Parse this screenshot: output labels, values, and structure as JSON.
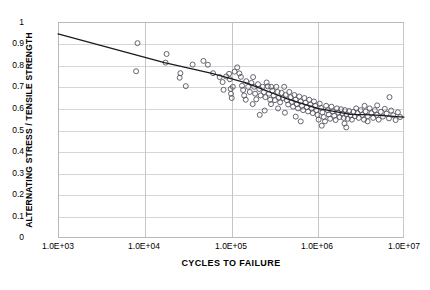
{
  "chart_data": {
    "type": "scatter",
    "title": "",
    "xlabel": "CYCLES TO FAILURE",
    "ylabel": "ALTERNATING STRESS / TENSILE STRENGTH",
    "xscale": "log",
    "yscale": "linear",
    "xlim": [
      1000,
      10000000
    ],
    "ylim": [
      0,
      1
    ],
    "grid": true,
    "legend": null,
    "xticks": [
      "1.0E+03",
      "1.0E+04",
      "1.0E+05",
      "1.0E+06",
      "1.0E+07"
    ],
    "xtick_values": [
      1000,
      10000,
      100000,
      1000000,
      10000000
    ],
    "yticks": [
      "0",
      "0.1",
      "0.2",
      "0.3",
      "0.4",
      "0.5",
      "0.6",
      "0.7",
      "0.8",
      "0.9",
      "1"
    ],
    "ytick_values": [
      0,
      0.1,
      0.2,
      0.3,
      0.4,
      0.5,
      0.6,
      0.7,
      0.8,
      0.9,
      1
    ],
    "marker": "open-circle",
    "marker_color": "#55555f",
    "series": [
      {
        "name": "fatigue data",
        "points": [
          [
            8300,
            0.902
          ],
          [
            8000,
            0.772
          ],
          [
            18000,
            0.852
          ],
          [
            17500,
            0.812
          ],
          [
            26000,
            0.763
          ],
          [
            25500,
            0.742
          ],
          [
            30000,
            0.703
          ],
          [
            36000,
            0.803
          ],
          [
            48000,
            0.82
          ],
          [
            54000,
            0.802
          ],
          [
            62000,
            0.763
          ],
          [
            74000,
            0.745
          ],
          [
            80000,
            0.722
          ],
          [
            82000,
            0.686
          ],
          [
            88000,
            0.748
          ],
          [
            95000,
            0.76
          ],
          [
            97000,
            0.735
          ],
          [
            99000,
            0.69
          ],
          [
            100000,
            0.668
          ],
          [
            102000,
            0.648
          ],
          [
            105000,
            0.7
          ],
          [
            110000,
            0.77
          ],
          [
            118000,
            0.79
          ],
          [
            125000,
            0.762
          ],
          [
            130000,
            0.746
          ],
          [
            134000,
            0.705
          ],
          [
            138000,
            0.685
          ],
          [
            142000,
            0.66
          ],
          [
            150000,
            0.726
          ],
          [
            158000,
            0.7
          ],
          [
            165000,
            0.676
          ],
          [
            172000,
            0.718
          ],
          [
            180000,
            0.745
          ],
          [
            185000,
            0.7
          ],
          [
            190000,
            0.668
          ],
          [
            196000,
            0.642
          ],
          [
            205000,
            0.712
          ],
          [
            212000,
            0.69
          ],
          [
            220000,
            0.66
          ],
          [
            232000,
            0.7
          ],
          [
            240000,
            0.675
          ],
          [
            250000,
            0.652
          ],
          [
            258000,
            0.72
          ],
          [
            266000,
            0.702
          ],
          [
            275000,
            0.668
          ],
          [
            284000,
            0.64
          ],
          [
            292000,
            0.7
          ],
          [
            300000,
            0.682
          ],
          [
            312000,
            0.66
          ],
          [
            322000,
            0.638
          ],
          [
            334000,
            0.7
          ],
          [
            345000,
            0.676
          ],
          [
            358000,
            0.65
          ],
          [
            370000,
            0.628
          ],
          [
            385000,
            0.672
          ],
          [
            398000,
            0.648
          ],
          [
            412000,
            0.7
          ],
          [
            428000,
            0.662
          ],
          [
            442000,
            0.638
          ],
          [
            458000,
            0.618
          ],
          [
            472000,
            0.676
          ],
          [
            490000,
            0.652
          ],
          [
            505000,
            0.63
          ],
          [
            522000,
            0.608
          ],
          [
            540000,
            0.662
          ],
          [
            558000,
            0.64
          ],
          [
            576000,
            0.62
          ],
          [
            595000,
            0.6
          ],
          [
            615000,
            0.655
          ],
          [
            638000,
            0.632
          ],
          [
            660000,
            0.612
          ],
          [
            682000,
            0.592
          ],
          [
            705000,
            0.648
          ],
          [
            728000,
            0.626
          ],
          [
            752000,
            0.606
          ],
          [
            778000,
            0.586
          ],
          [
            802000,
            0.64
          ],
          [
            828000,
            0.618
          ],
          [
            855000,
            0.6
          ],
          [
            882000,
            0.578
          ],
          [
            910000,
            0.632
          ],
          [
            940000,
            0.612
          ],
          [
            970000,
            0.592
          ],
          [
            1000000,
            0.57
          ],
          [
            1030000,
            0.548
          ],
          [
            1060000,
            0.622
          ],
          [
            1100000,
            0.602
          ],
          [
            1140000,
            0.582
          ],
          [
            1180000,
            0.56
          ],
          [
            1220000,
            0.54
          ],
          [
            1260000,
            0.612
          ],
          [
            1310000,
            0.592
          ],
          [
            1350000,
            0.572
          ],
          [
            1400000,
            0.552
          ],
          [
            1450000,
            0.608
          ],
          [
            1500000,
            0.586
          ],
          [
            1560000,
            0.566
          ],
          [
            1620000,
            0.546
          ],
          [
            1680000,
            0.6
          ],
          [
            1740000,
            0.58
          ],
          [
            1800000,
            0.56
          ],
          [
            1870000,
            0.596
          ],
          [
            1940000,
            0.576
          ],
          [
            2010000,
            0.556
          ],
          [
            2080000,
            0.592
          ],
          [
            2160000,
            0.572
          ],
          [
            2240000,
            0.552
          ],
          [
            2320000,
            0.588
          ],
          [
            2410000,
            0.568
          ],
          [
            2500000,
            0.548
          ],
          [
            2600000,
            0.584
          ],
          [
            2700000,
            0.564
          ],
          [
            2800000,
            0.6
          ],
          [
            2900000,
            0.578
          ],
          [
            3000000,
            0.556
          ],
          [
            3150000,
            0.592
          ],
          [
            3300000,
            0.57
          ],
          [
            3450000,
            0.548
          ],
          [
            3600000,
            0.586
          ],
          [
            3800000,
            0.564
          ],
          [
            4000000,
            0.6
          ],
          [
            4200000,
            0.578
          ],
          [
            4400000,
            0.556
          ],
          [
            4600000,
            0.592
          ],
          [
            4850000,
            0.57
          ],
          [
            5100000,
            0.548
          ],
          [
            5400000,
            0.584
          ],
          [
            5700000,
            0.562
          ],
          [
            6000000,
            0.598
          ],
          [
            6300000,
            0.576
          ],
          [
            6700000,
            0.554
          ],
          [
            7100000,
            0.59
          ],
          [
            7500000,
            0.568
          ],
          [
            8000000,
            0.546
          ],
          [
            8500000,
            0.582
          ],
          [
            9000000,
            0.56
          ],
          [
            6800000,
            0.652
          ],
          [
            2050000,
            0.53
          ],
          [
            2150000,
            0.512
          ],
          [
            1120000,
            0.52
          ],
          [
            640000,
            0.54
          ],
          [
            560000,
            0.562
          ],
          [
            420000,
            0.58
          ],
          [
            350000,
            0.6
          ],
          [
            290000,
            0.62
          ],
          [
            245000,
            0.59
          ],
          [
            215000,
            0.57
          ],
          [
            178000,
            0.62
          ],
          [
            148000,
            0.64
          ],
          [
            3500000,
            0.612
          ],
          [
            3800000,
            0.54
          ],
          [
            4900000,
            0.614
          ]
        ]
      }
    ],
    "trendline": {
      "name": "fitted S-N curve",
      "color": "#1a1a1a",
      "points": [
        [
          1000,
          0.945
        ],
        [
          17000,
          0.812
        ],
        [
          60000,
          0.762
        ],
        [
          150000,
          0.718
        ],
        [
          420000,
          0.648
        ],
        [
          1000000,
          0.6
        ],
        [
          2400000,
          0.572
        ],
        [
          4300000,
          0.57
        ],
        [
          10000000,
          0.56
        ]
      ]
    }
  },
  "axis": {
    "x_title": "CYCLES TO FAILURE",
    "y_title": "ALTERNATING STRESS / TENSILE STRENGTH"
  },
  "title_strip": ""
}
